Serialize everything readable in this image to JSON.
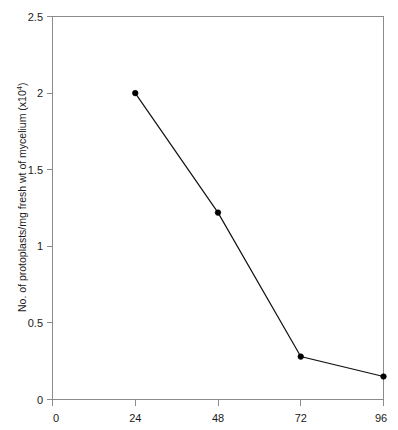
{
  "chart_data": {
    "type": "line",
    "title": "",
    "xlabel": "",
    "ylabel": "No. of protoplasts/mg fresh wt of mycelium (x10",
    "ylabel_superscript": "4",
    "ylabel_suffix": ")",
    "x": [
      24,
      48,
      72,
      96
    ],
    "values": [
      2.0,
      1.22,
      0.28,
      0.15
    ],
    "series": [
      {
        "name": "protoplast yield",
        "x": [
          24,
          48,
          72,
          96
        ],
        "values": [
          2.0,
          1.22,
          0.28,
          0.15
        ]
      }
    ],
    "xlim": [
      0,
      96
    ],
    "ylim": [
      0,
      2.5
    ],
    "xticks": [
      0,
      24,
      48,
      72,
      96
    ],
    "xtick_labels": [
      "0",
      "24",
      "48",
      "72",
      "96"
    ],
    "yticks": [
      0,
      0.5,
      1,
      1.5,
      2,
      2.5
    ],
    "ytick_labels": [
      "0",
      "0.5",
      "1",
      "1.5",
      "2",
      "2.5"
    ],
    "grid": false,
    "legend": null,
    "marker": "filled-circle",
    "line_color": "#111111",
    "marker_color": "#000000",
    "frame_color": "#8c8c8c",
    "background_color": "#ffffff"
  }
}
